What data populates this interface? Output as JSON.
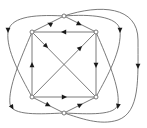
{
  "diagram": {
    "type": "directed-graph",
    "colors": {
      "edge": "#6b6b6b",
      "node_stroke": "#6b6b6b",
      "node_fill": "#ffffff",
      "arrow": "#1a1a1a",
      "background": "#ffffff"
    },
    "nodes": [
      {
        "id": "T",
        "x": 64,
        "y": 16
      },
      {
        "id": "TL",
        "x": 32,
        "y": 32
      },
      {
        "id": "TR",
        "x": 96,
        "y": 32
      },
      {
        "id": "BL",
        "x": 32,
        "y": 97
      },
      {
        "id": "BR",
        "x": 96,
        "y": 97
      },
      {
        "id": "B",
        "x": 64,
        "y": 113
      }
    ],
    "edges": [
      {
        "from": "T",
        "to": "TL",
        "path": "M64 16 L32 32",
        "arrow": {
          "x": 50,
          "y": 24,
          "angle": 207
        }
      },
      {
        "from": "T",
        "to": "TR",
        "path": "M64 16 L96 32",
        "arrow": {
          "x": 79,
          "y": 24,
          "angle": 27
        }
      },
      {
        "from": "TR",
        "to": "TL",
        "path": "M96 32 L32 32",
        "arrow": {
          "x": 64,
          "y": 32,
          "angle": 180
        }
      },
      {
        "from": "TR",
        "to": "BR",
        "path": "M96 32 L96 97",
        "arrow": {
          "x": 96,
          "y": 65,
          "angle": 90
        }
      },
      {
        "from": "BL",
        "to": "TL",
        "path": "M32 97 L32 32",
        "arrow": {
          "x": 32,
          "y": 65,
          "angle": 270
        }
      },
      {
        "from": "BL",
        "to": "BR",
        "path": "M32 97 L96 97",
        "arrow": {
          "x": 64,
          "y": 97,
          "angle": 0
        }
      },
      {
        "from": "BL",
        "to": "B",
        "path": "M32 97 L64 113",
        "arrow": {
          "x": 48,
          "y": 105,
          "angle": 27
        }
      },
      {
        "from": "B",
        "to": "BR",
        "path": "M64 113 L96 97",
        "arrow": {
          "x": 80,
          "y": 105,
          "angle": 333
        }
      },
      {
        "from": "TL",
        "to": "BR",
        "path": "M32 32 L96 97",
        "arrow": {
          "x": 46,
          "y": 46,
          "angle": 45
        }
      },
      {
        "from": "BL",
        "to": "TR",
        "path": "M32 97 L96 32",
        "arrow": {
          "x": 80,
          "y": 48,
          "angle": 315
        }
      },
      {
        "from": "T",
        "to": "BL",
        "path": "M64 16 C30 14 10 18 8 32 C6 50 20 75 32 97",
        "arrow": {
          "x": 8,
          "y": 30,
          "angle": 90
        }
      },
      {
        "from": "TL",
        "to": "B",
        "path": "M32 32 C20 60 8 88 10 104 C12 116 40 114 64 113",
        "arrow": {
          "x": 12,
          "y": 107,
          "angle": 60
        }
      },
      {
        "from": "T",
        "to": "BR",
        "path": "M64 16 C90 14 118 16 120 30 C122 50 108 75 96 97",
        "arrow": {
          "x": 120,
          "y": 30,
          "angle": 90
        }
      },
      {
        "from": "TR",
        "to": "B",
        "path": "M96 32 C108 60 120 88 118 104 C116 116 88 114 64 113",
        "arrow": {
          "x": 118,
          "y": 106,
          "angle": 100
        }
      },
      {
        "from": "T",
        "to": "B",
        "path": "M64 16 C100 4 138 6 138 40 C138 80 140 112 118 120 C100 126 80 118 64 113",
        "arrow": {
          "x": 138,
          "y": 66,
          "angle": 90
        }
      }
    ]
  }
}
